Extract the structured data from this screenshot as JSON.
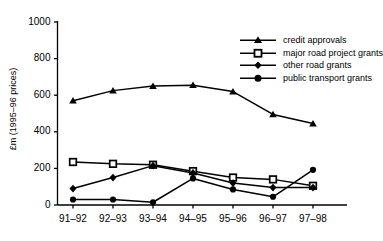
{
  "chart_data": {
    "type": "line",
    "title": "",
    "xlabel": "",
    "ylabel": "£m (1995–96 prices)",
    "categories": [
      "91–92",
      "92–93",
      "93–94",
      "94–95",
      "95–96",
      "96–97",
      "97–98"
    ],
    "ylim": [
      0,
      1000
    ],
    "yticks": [
      0,
      200,
      400,
      600,
      800,
      1000
    ],
    "ytick_labels": [
      "0",
      "200",
      "400",
      "600",
      "800",
      "1000"
    ],
    "grid": false,
    "legend_position": "top-right",
    "series": [
      {
        "name": "credit approvals",
        "marker": "triangle",
        "color": "#000000",
        "values": [
          570,
          625,
          650,
          655,
          620,
          495,
          445
        ]
      },
      {
        "name": "major road project grants",
        "marker": "open-square",
        "color": "#000000",
        "values": [
          235,
          225,
          220,
          185,
          150,
          140,
          105
        ]
      },
      {
        "name": "other road grants",
        "marker": "diamond",
        "color": "#000000",
        "values": [
          90,
          150,
          215,
          175,
          120,
          95,
          95
        ]
      },
      {
        "name": "public transport grants",
        "marker": "circle",
        "color": "#000000",
        "values": [
          30,
          30,
          15,
          145,
          85,
          45,
          192
        ]
      }
    ]
  }
}
